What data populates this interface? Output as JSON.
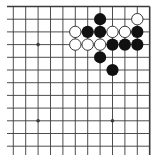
{
  "board": {
    "title": "Go board diagram — top-right corner",
    "size": 19,
    "visible_columns": 12,
    "visible_rows": 12,
    "edges": [
      "top",
      "right"
    ],
    "colors": {
      "background": "#ffffff",
      "line": "#3a3a3a",
      "black_stone": "#111111",
      "white_stone_fill": "#ffffff",
      "white_stone_stroke": "#222222"
    },
    "hoshi": [
      {
        "col": 2,
        "row": 3
      },
      {
        "col": 8,
        "row": 3
      },
      {
        "col": 2,
        "row": 9
      },
      {
        "col": 8,
        "row": 9
      }
    ],
    "stones": [
      {
        "color": "black",
        "col": 7,
        "row": 1
      },
      {
        "color": "white",
        "col": 10,
        "row": 1
      },
      {
        "color": "white",
        "col": 5,
        "row": 2
      },
      {
        "color": "black",
        "col": 6,
        "row": 2
      },
      {
        "color": "black",
        "col": 7,
        "row": 2
      },
      {
        "color": "white",
        "col": 8,
        "row": 2
      },
      {
        "color": "white",
        "col": 9,
        "row": 2
      },
      {
        "color": "black",
        "col": 10,
        "row": 2
      },
      {
        "color": "white",
        "col": 5,
        "row": 3
      },
      {
        "color": "white",
        "col": 6,
        "row": 3
      },
      {
        "color": "white",
        "col": 7,
        "row": 3
      },
      {
        "color": "black",
        "col": 8,
        "row": 3
      },
      {
        "color": "black",
        "col": 9,
        "row": 3
      },
      {
        "color": "black",
        "col": 10,
        "row": 3
      },
      {
        "color": "black",
        "col": 7,
        "row": 4
      },
      {
        "color": "black",
        "col": 8,
        "row": 5
      }
    ]
  }
}
